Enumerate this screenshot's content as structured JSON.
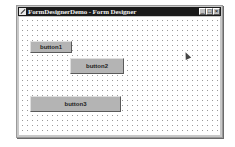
{
  "window": {
    "title": "FormDesignerDemo - Form Designer",
    "controls": {
      "minimize": "_",
      "maximize": "□",
      "close": "×"
    }
  },
  "designer": {
    "grid": "dotted",
    "buttons": [
      {
        "label": "button1"
      },
      {
        "label": "button2"
      },
      {
        "label": "button3"
      }
    ]
  },
  "cursor": {
    "icon": "pointer-cursor"
  }
}
